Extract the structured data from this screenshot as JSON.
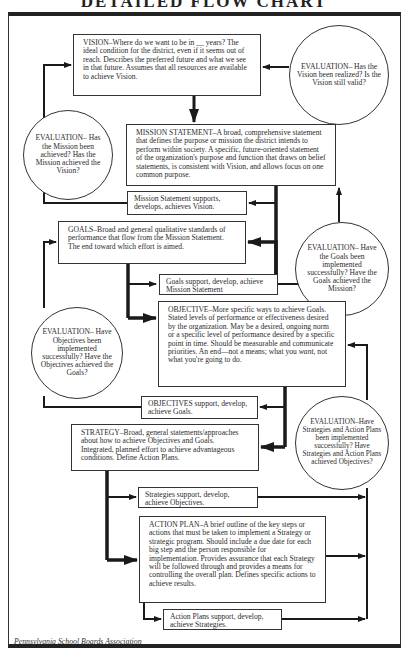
{
  "title": "DETAILED FLOW CHART",
  "nodes": {
    "vision": {
      "label": "VISION",
      "text": "VISION–Where do we want to be in __ years? The ideal condition for the district, even if it seems out of reach. Describes the preferred future and what we see in that future. Assumes that all resources are available to achieve Vision."
    },
    "eval_vision": {
      "text": "EVALUATION– Has the Vision been realized? Is the Vision still valid?"
    },
    "mission": {
      "label": "MISSION STATEMENT",
      "text": "MISSION STATEMENT–A broad, comprehensive statement that defines the purpose or mission the district intends to perform within society. A specific, future-oriented statement of the organization's purpose and function that draws on belief statements, is consistent with Vision, and allows focus on one common purpose."
    },
    "eval_mission": {
      "text": "EVALUATION– Has the Mission been achieved? Has the Mission achieved the Vision?"
    },
    "mission_support": {
      "text": "Mission Statement supports, develops, achieves Vision."
    },
    "goals": {
      "label": "GOALS",
      "text": "GOALS–Broad and general qualitative standards of performance that flow from the Mission Statement. The end toward which effort is aimed."
    },
    "eval_goals": {
      "text": "EVALUATION– Have the Goals been implemented successfully? Have the Goals achieved the Mission?"
    },
    "goals_support": {
      "text": "Goals support, develop, achieve Mission Statement"
    },
    "objective": {
      "label": "OBJECTIVE",
      "text_before_italic": "OBJECTIVE–More specific ways to achieve Goals. Stated levels of performance or effectiveness desired by the organization. May be a desired, ongoing norm or a specific level of performance desired by a specific point in time. Should be measurable and communicate priorities. An end—not a means; what you ",
      "italic": "want",
      "text_after_italic": ", not what you're going to do."
    },
    "eval_objectives": {
      "text": "EVALUATION– Have Objectives been implemented successfully? Have the Objectives achieved the Goals?"
    },
    "objectives_support": {
      "text": "OBJECTIVES support, develop, achieve Goals."
    },
    "strategy": {
      "label": "STRATEGY",
      "text": "STRATEGY–Broad, general statements/approaches about how to achieve Objectives and Goals. Integrated, planned effort to achieve advantageous conditions. Define Action Plans."
    },
    "eval_strategies": {
      "text": "EVALUATION–Have Strategies and Action Plans been implemented successfully? Have Strategies and Action Plans achieved Objectives?"
    },
    "strategies_support": {
      "text": "Strategies support, develop, achieve Objectives."
    },
    "action_plan": {
      "label": "ACTION PLAN",
      "text": "ACTION PLAN–A brief outline of the key steps or actions that must be taken to implement a Strategy or strategic program. Should include a due date for each big step and the person responsible for implementation. Provides assurance that each Strategy will be followed through and provides a means for controlling the overall plan. Defines specific actions to achieve results."
    },
    "action_support": {
      "text": "Action Plans support, develop, achieve Strategies."
    }
  },
  "footer": "Pennsylvania School Boards Association"
}
